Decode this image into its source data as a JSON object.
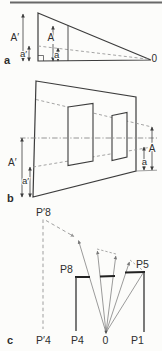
{
  "colors": {
    "paper": "#fcfcfa",
    "ink": "#3c3c3c",
    "dashed_lines": "#949494",
    "sight_rays": "#7a7a7a",
    "plan_wall": "#222222",
    "top_border": "#686868"
  },
  "panels": {
    "a": {
      "letter": "a",
      "vantage": "0",
      "left_size": "A′",
      "left_below_eye": "a′",
      "mid_size": "A",
      "mid_below_eye": "a"
    },
    "b": {
      "letter": "b",
      "left_size": "A′",
      "left_below_eye": "a′",
      "right_size": "A",
      "right_below_eye": "a"
    },
    "c": {
      "letter": "c",
      "vantage": "0",
      "projected_top": "P′8",
      "projected_bottom": "P′4",
      "wall_left": "P8",
      "wall_right": "P5",
      "base_left": "P4",
      "base_right": "P1"
    }
  }
}
